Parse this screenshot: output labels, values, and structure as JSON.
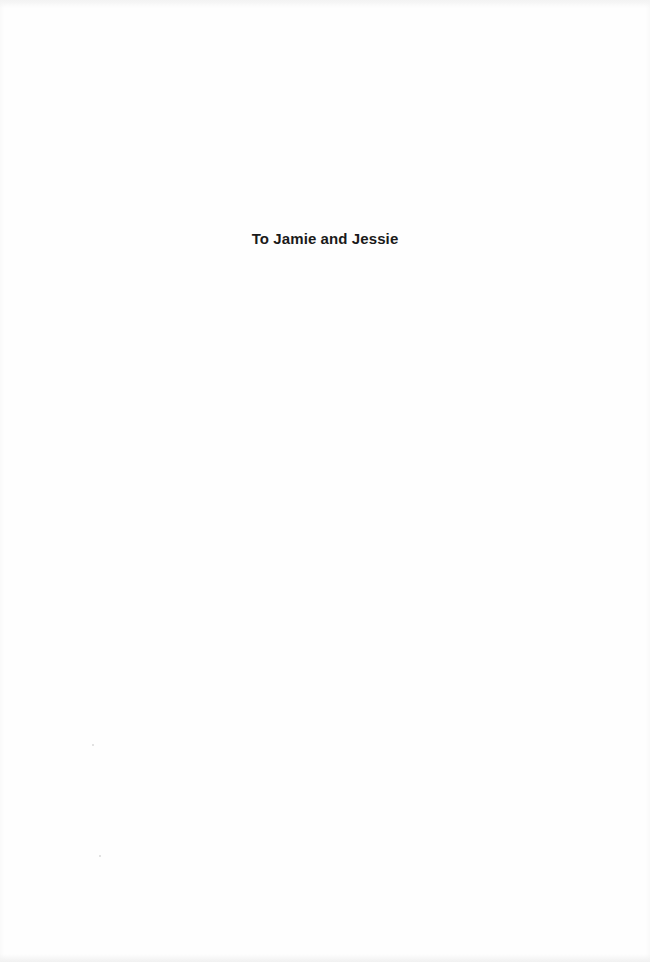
{
  "page": {
    "dedication": "To Jamie and Jessie",
    "text_color": "#1a1a1a",
    "background_color": "#fefefe"
  }
}
